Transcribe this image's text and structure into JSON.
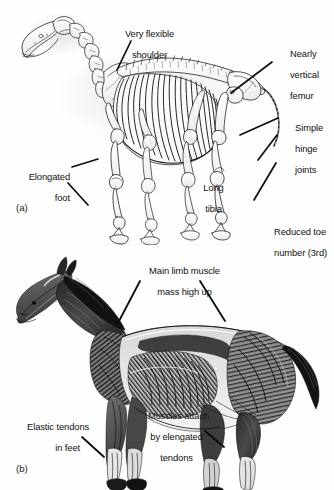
{
  "figure": {
    "ink_color": "#111111",
    "background_color": "#fefefe",
    "panels": [
      {
        "tag": "(a)",
        "subject": "horse-skeleton",
        "labels": [
          {
            "id": "very-flexible-shoulder",
            "lines": [
              "Very flexible",
              "shoulder"
            ]
          },
          {
            "id": "nearly-vertical-femur",
            "lines": [
              "Nearly",
              "vertical",
              "femur"
            ]
          },
          {
            "id": "simple-hinge-joints",
            "lines": [
              "Simple",
              "hinge",
              "joints"
            ]
          },
          {
            "id": "elongated-foot",
            "lines": [
              "Elongated",
              "foot"
            ]
          },
          {
            "id": "long-tibia",
            "lines": [
              "Long",
              "tibia"
            ]
          },
          {
            "id": "reduced-toe-number",
            "lines": [
              "Reduced toe",
              "number (3rd)"
            ]
          }
        ]
      },
      {
        "tag": "(b)",
        "subject": "horse-musculature",
        "labels": [
          {
            "id": "main-limb-muscle-mass",
            "lines": [
              "Main limb muscle",
              "mass high up"
            ]
          },
          {
            "id": "elastic-tendons-in-feet",
            "lines": [
              "Elastic tendons",
              "in feet"
            ]
          },
          {
            "id": "muscles-attach-by-tendons",
            "lines": [
              "Muscles attach",
              "by elengated",
              "tendons"
            ]
          }
        ]
      }
    ]
  }
}
